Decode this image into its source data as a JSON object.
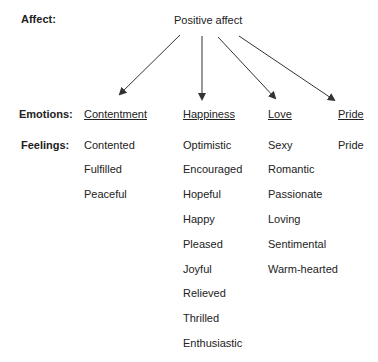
{
  "row_labels": {
    "affect": "Affect:",
    "emotions": "Emotions:",
    "feelings": "Feelings:"
  },
  "root": "Positive affect",
  "emotions": [
    {
      "name": "Contentment",
      "feelings": [
        "Contented",
        "Fulfilled",
        "Peaceful"
      ]
    },
    {
      "name": "Happiness",
      "feelings": [
        "Optimistic",
        "Encouraged",
        "Hopeful",
        "Happy",
        "Pleased",
        "Joyful",
        "Relieved",
        "Thrilled",
        "Enthusiastic"
      ]
    },
    {
      "name": "Love",
      "feelings": [
        "Sexy",
        "Romantic",
        "Passionate",
        "Loving",
        "Sentimental",
        "Warm-hearted"
      ]
    },
    {
      "name": "Pride",
      "feelings": [
        "Pride"
      ]
    }
  ],
  "colors": {
    "text": "#222222",
    "arrow": "#333333"
  }
}
